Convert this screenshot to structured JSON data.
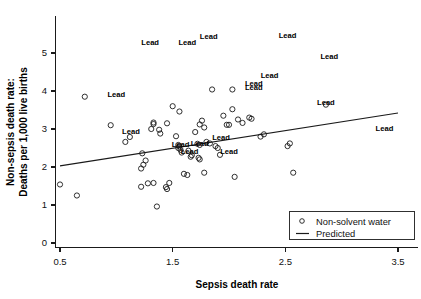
{
  "chart_data": {
    "type": "scatter",
    "title": "",
    "xlabel": "Sepsis death rate",
    "ylabel": "Non-sepsis death rate:\nDeaths per 1,000 live births",
    "ylabel_line1": "Non-sepsis death rate:",
    "ylabel_line2": "Deaths per 1,000 live births",
    "xlim": [
      0.35,
      3.62
    ],
    "ylim": [
      -0.12,
      5.45
    ],
    "xticks": [
      0.5,
      1.5,
      2.5,
      3.5
    ],
    "xtick_labels": [
      "0.5",
      "1.5",
      "2.5",
      "3.5"
    ],
    "yticks": [
      0,
      1,
      2,
      3,
      4,
      5
    ],
    "ytick_labels": [
      "0",
      "1",
      "2",
      "3",
      "4",
      "5"
    ],
    "grid": false,
    "legend_position": "lower right",
    "legend": [
      {
        "marker": "circle",
        "label": "Non-solvent water"
      },
      {
        "marker": "line",
        "label": "Predicted"
      }
    ],
    "series": [
      {
        "name": "Non-solvent water",
        "marker": "open-circle",
        "color": "#1a1a1a",
        "points": [
          [
            0.5,
            1.54
          ],
          [
            0.72,
            3.85
          ],
          [
            0.65,
            1.25
          ],
          [
            0.95,
            3.1
          ],
          [
            1.08,
            2.66
          ],
          [
            1.12,
            2.79
          ],
          [
            1.23,
            2.36
          ],
          [
            1.22,
            1.48
          ],
          [
            1.28,
            1.57
          ],
          [
            1.22,
            1.96
          ],
          [
            1.24,
            2.06
          ],
          [
            1.26,
            2.17
          ],
          [
            1.33,
            1.58
          ],
          [
            1.36,
            0.96
          ],
          [
            1.31,
            3.0
          ],
          [
            1.33,
            3.17
          ],
          [
            1.33,
            3.13
          ],
          [
            1.38,
            2.98
          ],
          [
            1.39,
            2.88
          ],
          [
            1.45,
            1.42
          ],
          [
            1.44,
            1.47
          ],
          [
            1.45,
            3.15
          ],
          [
            1.47,
            1.58
          ],
          [
            1.5,
            3.6
          ],
          [
            1.53,
            2.81
          ],
          [
            1.56,
            3.46
          ],
          [
            1.55,
            2.58
          ],
          [
            1.56,
            2.54
          ],
          [
            1.55,
            2.5
          ],
          [
            1.57,
            2.45
          ],
          [
            1.58,
            2.38
          ],
          [
            1.6,
            1.82
          ],
          [
            1.63,
            1.79
          ],
          [
            1.64,
            2.43
          ],
          [
            1.66,
            2.27
          ],
          [
            1.67,
            2.31
          ],
          [
            1.7,
            2.92
          ],
          [
            1.72,
            2.61
          ],
          [
            1.74,
            2.58
          ],
          [
            1.74,
            3.12
          ],
          [
            1.76,
            3.22
          ],
          [
            1.78,
            3.04
          ],
          [
            1.73,
            2.24
          ],
          [
            1.74,
            2.2
          ],
          [
            1.78,
            1.85
          ],
          [
            1.8,
            2.66
          ],
          [
            1.83,
            2.62
          ],
          [
            1.85,
            4.04
          ],
          [
            1.88,
            2.55
          ],
          [
            1.9,
            2.5
          ],
          [
            1.92,
            2.32
          ],
          [
            1.95,
            3.35
          ],
          [
            1.98,
            3.11
          ],
          [
            2.0,
            3.11
          ],
          [
            2.03,
            3.52
          ],
          [
            2.05,
            1.74
          ],
          [
            2.08,
            3.25
          ],
          [
            2.12,
            3.16
          ],
          [
            2.18,
            3.3
          ],
          [
            2.2,
            3.27
          ],
          [
            2.28,
            2.8
          ],
          [
            2.31,
            2.86
          ],
          [
            2.52,
            2.55
          ],
          [
            2.54,
            2.62
          ],
          [
            2.57,
            1.85
          ],
          [
            2.86,
            3.64
          ],
          [
            2.03,
            4.04
          ]
        ]
      }
    ],
    "fit_line": {
      "name": "Predicted",
      "color": "#1a1a1a",
      "x": [
        0.5,
        3.5
      ],
      "y": [
        2.03,
        3.42
      ]
    },
    "annotations": {
      "text": "Lead",
      "items": [
        {
          "label": "Lead",
          "x": 1.3,
          "y": 5.22
        },
        {
          "label": "Lead",
          "x": 1.63,
          "y": 5.22
        },
        {
          "label": "Lead",
          "x": 1.82,
          "y": 5.38
        },
        {
          "label": "Lead",
          "x": 2.52,
          "y": 5.39
        },
        {
          "label": "Lead",
          "x": 2.89,
          "y": 4.83
        },
        {
          "label": "Lead",
          "x": 2.36,
          "y": 4.33
        },
        {
          "label": "Lead",
          "x": 2.22,
          "y": 4.12
        },
        {
          "label": "Lead",
          "x": 2.22,
          "y": 4.02
        },
        {
          "label": "Lead",
          "x": 2.86,
          "y": 3.64
        },
        {
          "label": "Lead",
          "x": 1.0,
          "y": 3.83
        },
        {
          "label": "Lead",
          "x": 3.38,
          "y": 2.96
        },
        {
          "label": "Lead",
          "x": 1.13,
          "y": 2.87
        },
        {
          "label": "Lead",
          "x": 1.93,
          "y": 2.72
        },
        {
          "label": "Lead",
          "x": 1.57,
          "y": 2.52
        },
        {
          "label": "Lead",
          "x": 1.74,
          "y": 2.56
        },
        {
          "label": "Lead",
          "x": 1.65,
          "y": 2.34
        },
        {
          "label": "Lead",
          "x": 2.0,
          "y": 2.33
        }
      ]
    }
  },
  "legend": {
    "items": [
      {
        "label": "Non-solvent water",
        "marker": "open-circle"
      },
      {
        "label": "Predicted",
        "marker": "line"
      }
    ]
  },
  "axes": {
    "x_title": "Sepsis death rate",
    "y_title_line1": "Non-sepsis death rate:",
    "y_title_line2": "Deaths per 1,000 live births"
  }
}
